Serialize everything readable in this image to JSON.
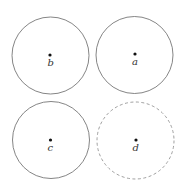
{
  "diagram": {
    "circles": [
      {
        "id": "b",
        "label": "b",
        "cx": 50.5,
        "cy": 55.5,
        "r": 38.5,
        "style": "solid",
        "stroke": "#666666"
      },
      {
        "id": "a",
        "label": "a",
        "cx": 134.5,
        "cy": 55,
        "r": 38.5,
        "style": "solid",
        "stroke": "#666666"
      },
      {
        "id": "c",
        "label": "c",
        "cx": 51,
        "cy": 140,
        "r": 38.5,
        "style": "solid",
        "stroke": "#666666"
      },
      {
        "id": "d",
        "label": "d",
        "cx": 135.5,
        "cy": 140.5,
        "r": 38.5,
        "style": "dashed",
        "stroke": "#888888"
      }
    ],
    "point_color": "#111111"
  }
}
